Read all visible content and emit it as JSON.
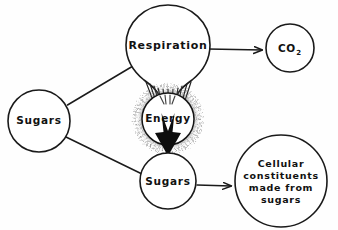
{
  "diagram": {
    "background_color": "#fefefe",
    "ink_color": "#1a1a1a",
    "nodes": {
      "respiration": {
        "label": "Respiration",
        "shape": "balloon",
        "cx": 168,
        "cy": 46,
        "r": 42
      },
      "co2": {
        "label": "CO",
        "subscript": "2",
        "shape": "circle",
        "cx": 290,
        "cy": 48,
        "r": 24
      },
      "sugars_left": {
        "label": "Sugars",
        "shape": "circle",
        "cx": 39,
        "cy": 121,
        "r": 31
      },
      "energy": {
        "label": "Energy",
        "shape": "circle-glow",
        "cx": 168,
        "cy": 119,
        "r": 28
      },
      "sugars_bottom": {
        "label": "Sugars",
        "shape": "circle",
        "cx": 168,
        "cy": 181,
        "r": 28
      },
      "cellular": {
        "label_lines": [
          "Cellular",
          "constituents",
          "made  from",
          "sugars"
        ],
        "shape": "circle",
        "cx": 281,
        "cy": 181,
        "r": 46
      }
    },
    "edges": [
      {
        "name": "sugars-left-to-respiration",
        "from": "sugars_left",
        "to": "respiration",
        "arrow": false
      },
      {
        "name": "respiration-to-co2",
        "from": "respiration",
        "to": "co2",
        "arrow": true
      },
      {
        "name": "respiration-rays-to-energy",
        "from": "respiration",
        "to": "energy",
        "arrow": false,
        "style": "rays",
        "ray_count": 10
      },
      {
        "name": "energy-to-sugars-bottom",
        "from": "energy",
        "to": "sugars_bottom",
        "arrow": true,
        "style": "thick"
      },
      {
        "name": "sugars-left-to-sugars-bottom",
        "from": "sugars_left",
        "to": "sugars_bottom",
        "arrow": false
      },
      {
        "name": "sugars-bottom-to-cellular",
        "from": "sugars_bottom",
        "to": "cellular",
        "arrow": true
      }
    ]
  }
}
